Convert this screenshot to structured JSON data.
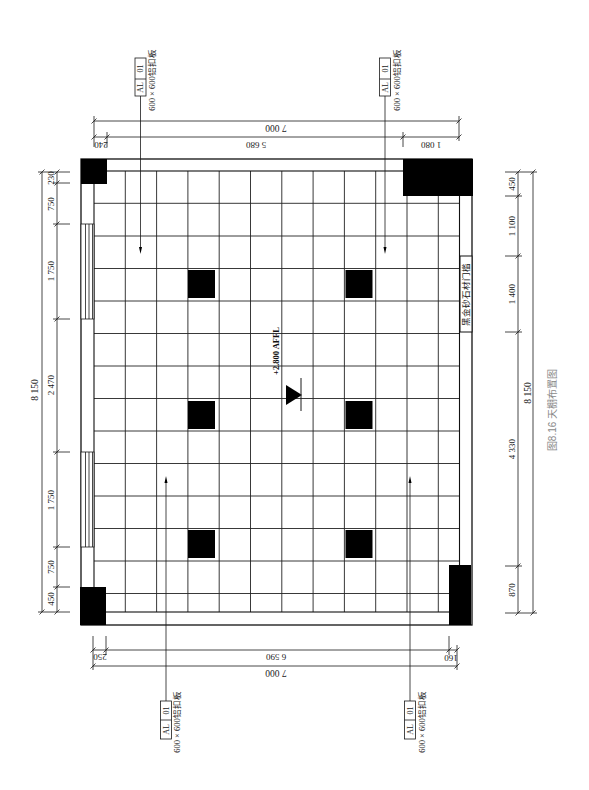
{
  "figure": {
    "caption": "图8.16  天棚布置图"
  },
  "plan": {
    "elevation_label": "+2.800 AFFL",
    "threshold_label": "黑金砂石材门槛",
    "material_tags": [
      {
        "code": "AL",
        "number": "01",
        "description": "600 × 600铝扣板"
      },
      {
        "code": "AL",
        "number": "01",
        "description": "600 × 600铝扣板"
      },
      {
        "code": "AL",
        "number": "01",
        "description": "600 × 600铝扣板"
      },
      {
        "code": "AL",
        "number": "01",
        "description": "600 × 600铝扣板"
      }
    ],
    "ceiling_grid_module": "600 × 600",
    "light_fixture_count": 6
  },
  "dimensions": {
    "top": {
      "total": "7 000",
      "segments": [
        "240",
        "5 680",
        "1 080"
      ]
    },
    "bottom": {
      "total": "7 000",
      "segments": [
        "250",
        "6 590",
        "160"
      ]
    },
    "left": {
      "total": "8 150",
      "segments": [
        "230",
        "750",
        "1 750",
        "2 470",
        "1 750",
        "750",
        "450"
      ]
    },
    "right": {
      "total": "8 150",
      "segments": [
        "450",
        "1 100",
        "1 400",
        "4 330",
        "870"
      ]
    }
  },
  "colors": {
    "line": "#1a1a1a",
    "solid_fill": "#000000",
    "caption": "#8a8a8a",
    "background": "#ffffff"
  }
}
